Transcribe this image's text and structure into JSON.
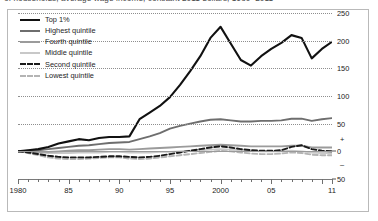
{
  "title": {
    "clipped_text": "of households, average wage income, constant 2011 dollars, 1980–2011"
  },
  "legend": {
    "items": [
      {
        "label": "Top 1%",
        "color": "#111111",
        "style": "solid",
        "width": 2.4
      },
      {
        "label": "Highest quintile",
        "color": "#6e6e6e",
        "style": "solid",
        "width": 2.4
      },
      {
        "label": "Fourth quintile",
        "color": "#9b9b9b",
        "style": "solid",
        "width": 2.4
      },
      {
        "label": "Middle quintile",
        "color": "#c8c8c8",
        "style": "solid",
        "width": 2.4
      },
      {
        "label": "Second quintile",
        "color": "#1a1a1a",
        "style": "dashed",
        "width": 2.4
      },
      {
        "label": "Lowest quintile",
        "color": "#b4b4b4",
        "style": "dashed",
        "width": 2.4
      }
    ]
  },
  "axes": {
    "y_ticks": [
      250,
      200,
      150,
      100,
      50,
      0,
      50
    ],
    "y_tick_labels": [
      "250",
      "200",
      "150",
      "100",
      "50",
      "0",
      "50"
    ],
    "y_plus_sign": "+",
    "y_minus_sign": "–",
    "ylim": [
      -50,
      250
    ],
    "x_tick_labels": [
      "1980",
      "85",
      "90",
      "95",
      "2000",
      "05",
      "11"
    ],
    "x_tick_values": [
      1980,
      1985,
      1990,
      1995,
      2000,
      2005,
      2011
    ],
    "xlim": [
      1980,
      2011
    ],
    "grid": "horizontal-dotted"
  },
  "chart_data": {
    "type": "line",
    "title": "of households, average wage income, constant 2011 dollars, 1980–2011",
    "xlabel": "",
    "ylabel": "",
    "xlim": [
      1980,
      2011
    ],
    "ylim": [
      -50,
      250
    ],
    "grid": true,
    "legend_position": "top-left",
    "x": [
      1980,
      1981,
      1982,
      1983,
      1984,
      1985,
      1986,
      1987,
      1988,
      1989,
      1990,
      1991,
      1992,
      1993,
      1994,
      1995,
      1996,
      1997,
      1998,
      1999,
      2000,
      2001,
      2002,
      2003,
      2004,
      2005,
      2006,
      2007,
      2008,
      2009,
      2010,
      2011
    ],
    "series": [
      {
        "name": "Top 1%",
        "color": "#111111",
        "style": "solid",
        "values": [
          0,
          2,
          4,
          8,
          14,
          18,
          22,
          20,
          24,
          26,
          26,
          27,
          58,
          70,
          82,
          98,
          120,
          145,
          172,
          205,
          225,
          195,
          165,
          155,
          172,
          185,
          196,
          210,
          205,
          168,
          185,
          198
        ]
      },
      {
        "name": "Highest quintile",
        "color": "#6e6e6e",
        "style": "solid",
        "values": [
          0,
          1,
          2,
          4,
          6,
          8,
          10,
          11,
          13,
          15,
          16,
          17,
          22,
          27,
          33,
          41,
          46,
          50,
          54,
          57,
          58,
          56,
          54,
          54,
          55,
          55,
          56,
          59,
          59,
          55,
          58,
          60
        ]
      },
      {
        "name": "Fourth quintile",
        "color": "#9b9b9b",
        "style": "solid",
        "values": [
          0,
          0,
          -1,
          -1,
          0,
          1,
          2,
          2,
          3,
          4,
          4,
          3,
          4,
          5,
          6,
          7,
          8,
          9,
          10,
          11,
          12,
          11,
          10,
          9,
          9,
          9,
          9,
          10,
          10,
          7,
          7,
          7
        ]
      },
      {
        "name": "Middle quintile",
        "color": "#c8c8c8",
        "style": "solid",
        "values": [
          0,
          -1,
          -2,
          -3,
          -3,
          -3,
          -2,
          -2,
          -2,
          -1,
          -1,
          -2,
          -2,
          -2,
          -1,
          -1,
          0,
          1,
          2,
          3,
          4,
          3,
          2,
          1,
          0,
          0,
          0,
          1,
          0,
          -2,
          -3,
          -3
        ]
      },
      {
        "name": "Second quintile",
        "color": "#1a1a1a",
        "style": "dashed",
        "values": [
          0,
          -2,
          -5,
          -8,
          -10,
          -11,
          -11,
          -11,
          -10,
          -9,
          -9,
          -10,
          -11,
          -10,
          -8,
          -5,
          -2,
          1,
          4,
          7,
          9,
          7,
          4,
          2,
          1,
          1,
          2,
          8,
          11,
          4,
          1,
          0
        ]
      },
      {
        "name": "Lowest quintile",
        "color": "#b4b4b4",
        "style": "dashed",
        "values": [
          0,
          -3,
          -7,
          -11,
          -13,
          -14,
          -14,
          -13,
          -12,
          -11,
          -11,
          -13,
          -14,
          -13,
          -11,
          -9,
          -7,
          -5,
          -3,
          -1,
          1,
          0,
          -2,
          -4,
          -5,
          -5,
          -4,
          -2,
          -3,
          -6,
          -7,
          -7
        ]
      }
    ]
  }
}
